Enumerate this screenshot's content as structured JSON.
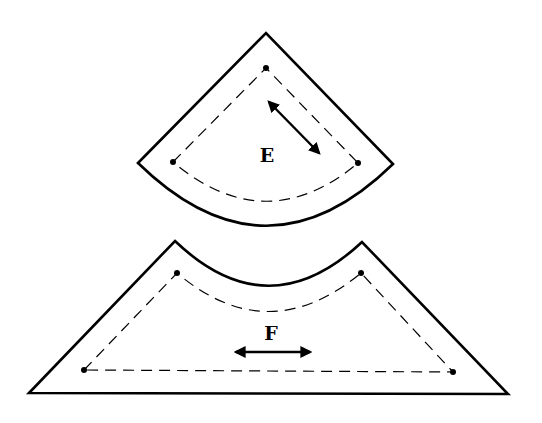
{
  "diagram": {
    "type": "sewing-pattern-pieces",
    "colors": {
      "stroke": "#000000",
      "background": "#ffffff"
    },
    "pieces": [
      {
        "id": "E",
        "label": "E",
        "shape": "fan / circular sector with curved bottom edge",
        "grainline": "diagonal double-headed arrow"
      },
      {
        "id": "F",
        "label": "F",
        "shape": "trapezoid with concave curved top edge",
        "grainline": "horizontal double-headed arrow"
      }
    ]
  }
}
